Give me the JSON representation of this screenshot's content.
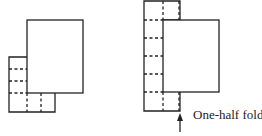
{
  "diagram": {
    "left_figure": {
      "name": "folded-paper-quarter",
      "stroke_color": "#222222"
    },
    "right_figure": {
      "name": "folded-paper-half",
      "stroke_color": "#222222",
      "annotation": "One-half fold"
    }
  }
}
